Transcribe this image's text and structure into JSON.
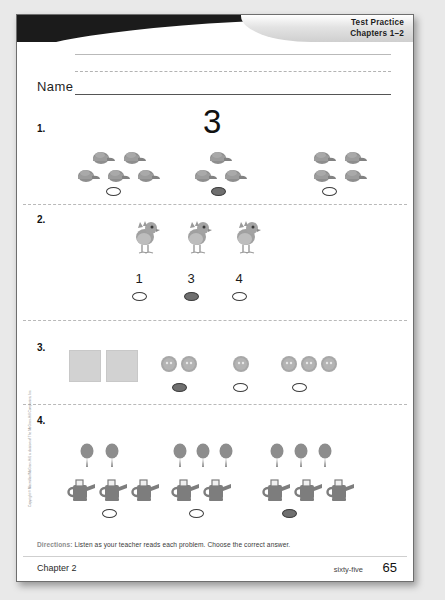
{
  "banner": {
    "line1": "Test Practice",
    "line2": "Chapters 1–2"
  },
  "name_field": {
    "label": "Name",
    "value": ""
  },
  "problems": [
    {
      "number": "1.",
      "prompt_number": "3",
      "groups": [
        {
          "count": 5,
          "item": "cap",
          "selected": false
        },
        {
          "count": 3,
          "item": "cap",
          "selected": true
        },
        {
          "count": 4,
          "item": "cap",
          "selected": false
        }
      ]
    },
    {
      "number": "2.",
      "stimulus_count": 3,
      "stimulus_item": "chick",
      "choices": [
        {
          "label": "1",
          "selected": false
        },
        {
          "label": "3",
          "selected": true
        },
        {
          "label": "4",
          "selected": false
        }
      ]
    },
    {
      "number": "3.",
      "stimulus_count": 2,
      "stimulus_item": "block",
      "groups": [
        {
          "count": 2,
          "item": "button",
          "selected": true
        },
        {
          "count": 1,
          "item": "button",
          "selected": false
        },
        {
          "count": 3,
          "item": "button",
          "selected": false
        }
      ]
    },
    {
      "number": "4.",
      "groups": [
        {
          "balloons": 2,
          "cans": 3,
          "selected": false
        },
        {
          "balloons": 3,
          "cans": 2,
          "selected": false
        },
        {
          "balloons": 3,
          "cans": 3,
          "selected": true
        }
      ]
    }
  ],
  "directions": {
    "label": "Directions:",
    "text": "Listen as your teacher reads each problem. Choose the correct answer."
  },
  "footer": {
    "chapter": "Chapter 2",
    "page_word": "sixty-five",
    "page_number": "65"
  },
  "copyright": "Copyright © Macmillan/McGraw-Hill, a division of The McGraw-Hill Companies, Inc."
}
